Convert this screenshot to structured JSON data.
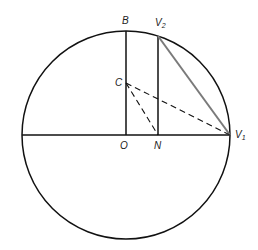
{
  "diagram": {
    "type": "geometry",
    "colors": {
      "line": "#111111",
      "highlight_chord": "#7a7a7a",
      "label": "#222222"
    },
    "circle": {
      "center": "O",
      "cx": 126,
      "cy": 135,
      "r": 104
    },
    "points": {
      "B": {
        "label": "B",
        "x": 126,
        "y": 31
      },
      "V2": {
        "label": "V",
        "sub": "2",
        "x": 158,
        "y": 36
      },
      "C": {
        "label": "C",
        "x": 126,
        "y": 83
      },
      "O": {
        "label": "O",
        "x": 126,
        "y": 135
      },
      "N": {
        "label": "N",
        "x": 158,
        "y": 135
      },
      "V1": {
        "label": "V",
        "sub": "1",
        "x": 230,
        "y": 135
      }
    },
    "segments": [
      {
        "from": "left-edge",
        "to": "V1",
        "style": "solid",
        "name": "horizontal-diameter"
      },
      {
        "from": "O",
        "to": "B",
        "style": "solid",
        "name": "radius-OB"
      },
      {
        "from": "N",
        "to": "V2",
        "style": "solid",
        "name": "segment-NV2"
      },
      {
        "from": "V2",
        "to": "V1",
        "style": "solid-gray",
        "name": "chord-V2V1"
      },
      {
        "from": "C",
        "to": "V1",
        "style": "dashed",
        "name": "segment-CV1"
      },
      {
        "from": "C",
        "to": "N",
        "style": "dashed",
        "name": "segment-CN"
      }
    ]
  }
}
